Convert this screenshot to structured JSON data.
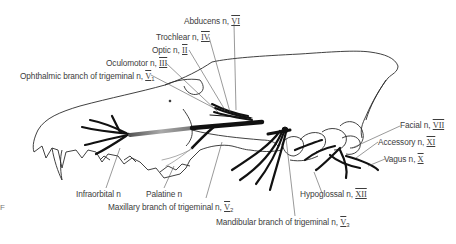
{
  "figure": {
    "colors": {
      "outline": "#2b2b2b",
      "nerve": "#111111",
      "label": "#3d3d3d",
      "leader": "#555555",
      "background": "#ffffff"
    }
  },
  "labels": [
    {
      "id": "abducens",
      "name": "Abducens n,",
      "roman": "VI",
      "sub": ""
    },
    {
      "id": "trochlear",
      "name": "Trochlear n,",
      "roman": "IV",
      "sub": ""
    },
    {
      "id": "optic",
      "name": "Optic n,",
      "roman": "II",
      "sub": ""
    },
    {
      "id": "oculomotor",
      "name": "Oculomotor n,",
      "roman": "III",
      "sub": ""
    },
    {
      "id": "ophthalmic",
      "name": "Ophthalmic branch of trigeminal n,",
      "roman": "V",
      "sub": "1"
    },
    {
      "id": "facial",
      "name": "Facial n,",
      "roman": "VII",
      "sub": ""
    },
    {
      "id": "accessory",
      "name": "Accessory n,",
      "roman": "XI",
      "sub": ""
    },
    {
      "id": "vagus",
      "name": "Vagus n,",
      "roman": "X",
      "sub": ""
    },
    {
      "id": "hypoglossal",
      "name": "Hypoglossal n,",
      "roman": "XII",
      "sub": ""
    },
    {
      "id": "mandibular",
      "name": "Mandibular branch of trigeminal n,",
      "roman": "V",
      "sub": "3"
    },
    {
      "id": "maxillary",
      "name": "Maxillary branch of trigeminal n,",
      "roman": "V",
      "sub": "2"
    },
    {
      "id": "infraorbital",
      "name": "Infraorbital n",
      "roman": "",
      "sub": ""
    },
    {
      "id": "palatine",
      "name": "Palatine n",
      "roman": "",
      "sub": ""
    }
  ],
  "edge_mark": "F"
}
